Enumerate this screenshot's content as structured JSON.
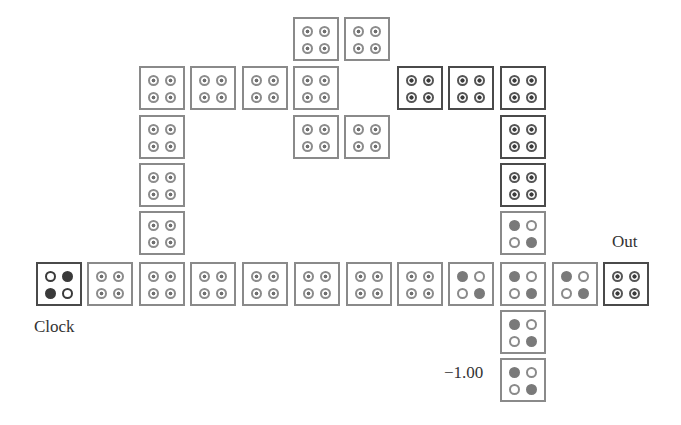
{
  "labels": {
    "clock": "Clock",
    "out": "Out",
    "fixed_polarization": "−1.00"
  },
  "colors": {
    "cell_border_light": "#8a8a8a",
    "cell_border_dark": "#4a4a4a",
    "dot_filled": "#7a7a7a",
    "background": "#ffffff"
  },
  "cells": [
    {
      "x": 293,
      "y": 17,
      "state": "neutral",
      "dark": false
    },
    {
      "x": 344,
      "y": 17,
      "state": "neutral",
      "dark": false
    },
    {
      "x": 139,
      "y": 66,
      "state": "neutral",
      "dark": false
    },
    {
      "x": 190,
      "y": 66,
      "state": "neutral",
      "dark": false
    },
    {
      "x": 242,
      "y": 66,
      "state": "neutral",
      "dark": false
    },
    {
      "x": 293,
      "y": 66,
      "state": "neutral",
      "dark": false
    },
    {
      "x": 397,
      "y": 66,
      "state": "neutral",
      "dark": true
    },
    {
      "x": 448,
      "y": 66,
      "state": "neutral",
      "dark": true
    },
    {
      "x": 500,
      "y": 66,
      "state": "neutral",
      "dark": true
    },
    {
      "x": 139,
      "y": 115,
      "state": "neutral",
      "dark": false
    },
    {
      "x": 293,
      "y": 115,
      "state": "neutral",
      "dark": false
    },
    {
      "x": 344,
      "y": 115,
      "state": "neutral",
      "dark": false
    },
    {
      "x": 500,
      "y": 115,
      "state": "neutral",
      "dark": true
    },
    {
      "x": 139,
      "y": 163,
      "state": "neutral",
      "dark": false
    },
    {
      "x": 500,
      "y": 163,
      "state": "neutral",
      "dark": true
    },
    {
      "x": 139,
      "y": 211,
      "state": "neutral",
      "dark": false
    },
    {
      "x": 500,
      "y": 211,
      "state": "minus",
      "dark": false
    },
    {
      "x": 36,
      "y": 262,
      "state": "plus",
      "dark": true,
      "role": "clock"
    },
    {
      "x": 87,
      "y": 262,
      "state": "neutral",
      "dark": false
    },
    {
      "x": 139,
      "y": 262,
      "state": "neutral",
      "dark": false
    },
    {
      "x": 190,
      "y": 262,
      "state": "neutral",
      "dark": false
    },
    {
      "x": 242,
      "y": 262,
      "state": "neutral",
      "dark": false
    },
    {
      "x": 294,
      "y": 262,
      "state": "neutral",
      "dark": false
    },
    {
      "x": 346,
      "y": 262,
      "state": "neutral",
      "dark": false
    },
    {
      "x": 397,
      "y": 262,
      "state": "neutral",
      "dark": false
    },
    {
      "x": 448,
      "y": 262,
      "state": "minus",
      "dark": false
    },
    {
      "x": 500,
      "y": 262,
      "state": "minus",
      "dark": false
    },
    {
      "x": 552,
      "y": 262,
      "state": "minus",
      "dark": false
    },
    {
      "x": 603,
      "y": 262,
      "state": "neutral",
      "dark": true,
      "role": "out"
    },
    {
      "x": 500,
      "y": 310,
      "state": "minus",
      "dark": false
    },
    {
      "x": 500,
      "y": 358,
      "state": "minus",
      "dark": false,
      "role": "fixed"
    }
  ]
}
